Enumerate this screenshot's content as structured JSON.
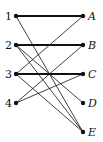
{
  "diagram": {
    "type": "bipartite-graph",
    "left_nodes": [
      {
        "id": "1",
        "label": "1",
        "x": 16,
        "y": 16
      },
      {
        "id": "2",
        "label": "2",
        "x": 16,
        "y": 45
      },
      {
        "id": "3",
        "label": "3",
        "x": 16,
        "y": 74
      },
      {
        "id": "4",
        "label": "4",
        "x": 16,
        "y": 103
      }
    ],
    "right_nodes": [
      {
        "id": "A",
        "label": "A",
        "x": 83,
        "y": 16
      },
      {
        "id": "B",
        "label": "B",
        "x": 83,
        "y": 45
      },
      {
        "id": "C",
        "label": "C",
        "x": 83,
        "y": 74
      },
      {
        "id": "D",
        "label": "D",
        "x": 83,
        "y": 103
      },
      {
        "id": "E",
        "label": "E",
        "x": 83,
        "y": 132
      }
    ],
    "edges": [
      {
        "from": "1",
        "to": "A",
        "thick": true
      },
      {
        "from": "1",
        "to": "E",
        "thick": false
      },
      {
        "from": "2",
        "to": "B",
        "thick": true
      },
      {
        "from": "2",
        "to": "D",
        "thick": false
      },
      {
        "from": "2",
        "to": "E",
        "thick": false
      },
      {
        "from": "3",
        "to": "A",
        "thick": false
      },
      {
        "from": "3",
        "to": "C",
        "thick": true
      },
      {
        "from": "3",
        "to": "E",
        "thick": false
      },
      {
        "from": "4",
        "to": "B",
        "thick": false
      },
      {
        "from": "4",
        "to": "C",
        "thick": false
      }
    ],
    "colors": {
      "line": "#111111",
      "node": "#111111",
      "background": "#ffffff"
    }
  }
}
